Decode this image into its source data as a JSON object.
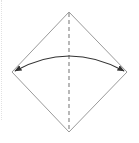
{
  "diagram": {
    "type": "origami-fold-step",
    "shape": "square-diamond",
    "fold_line": "valley-fold-vertical",
    "arrow": "double-headed-curved",
    "colors": {
      "outline": "#9a9a9a",
      "fold_line": "#8a8a8a",
      "arrow": "#333333",
      "guide": "#e2e2e2"
    }
  }
}
